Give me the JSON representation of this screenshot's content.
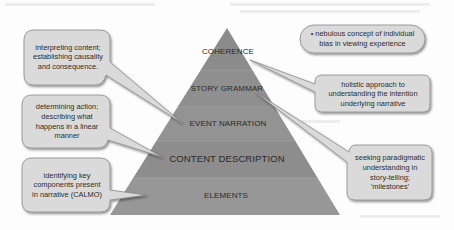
{
  "diagram": {
    "type": "pyramid",
    "layers": [
      {
        "id": "coherence",
        "label": "COHERENCE"
      },
      {
        "id": "story-grammar",
        "label": "STORY GRAMMAR"
      },
      {
        "id": "event-narration",
        "label": "EVENT NARRATION"
      },
      {
        "id": "content-description",
        "label": "CONTENT DESCRIPTION"
      },
      {
        "id": "elements",
        "label": "ELEMENTS"
      }
    ],
    "callouts": {
      "coherence_note": "• nebulous concept of individual bias in viewing experience",
      "holistic": "holistic approach to understanding the intention underlying narrative",
      "seeking": "seeking paradigmatic understanding in story-telling; 'milestones'",
      "interpreting": "interpreting content; establishing causality and consequence.",
      "determining": "determining action; describing what happens in a linear manner",
      "identifying": "identifying key components present in narrative (CALMO)"
    },
    "colors": {
      "layer_top": "#8c8c8c",
      "layer_2": "#8f8f8f",
      "layer_3": "#939393",
      "layer_4": "#8e8e8e",
      "layer_5": "#979797",
      "callout_fill": "#dcdcdc",
      "callout_stroke": "#8a8a8a"
    }
  }
}
